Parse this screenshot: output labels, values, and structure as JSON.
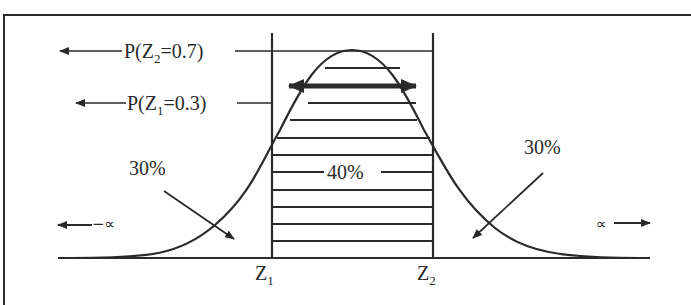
{
  "diagram": {
    "type": "normal-distribution",
    "labels": {
      "p_z2": "P(Z",
      "p_z2_sub": "2",
      "p_z2_val": "=0.7)",
      "p_z1": "P(Z",
      "p_z1_sub": "1",
      "p_z1_val": "=0.3)",
      "center_pct": "40%",
      "left_pct": "30%",
      "right_pct": "30%",
      "neg_inf": "−∝",
      "pos_inf": "∝",
      "z1": "Z",
      "z1_sub": "1",
      "z2": "Z",
      "z2_sub": "2"
    },
    "regions": [
      {
        "name": "left-tail",
        "percent": 30
      },
      {
        "name": "center",
        "percent": 40
      },
      {
        "name": "right-tail",
        "percent": 30
      }
    ],
    "colors": {
      "ink": "#2a2a2a",
      "background": "#ffffff"
    }
  }
}
